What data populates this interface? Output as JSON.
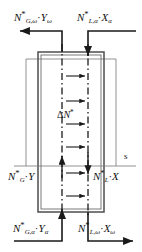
{
  "diagram": {
    "stream_labels": {
      "top_left": {
        "base": "N",
        "sub1": "G,ω",
        "star": "*",
        "times": "·",
        "var": "Y",
        "var_sub": "ω"
      },
      "top_right": {
        "base": "N",
        "sub1": "L,α",
        "star": "*",
        "times": "·",
        "var": "X",
        "var_sub": "α"
      },
      "mid_left": {
        "base": "N",
        "sub1": "G",
        "star": "*",
        "times": "·",
        "var": "Y",
        "var_sub": ""
      },
      "mid_right": {
        "base": "N",
        "sub1": "L",
        "star": "*",
        "times": "·",
        "var": "X",
        "var_sub": ""
      },
      "bottom_left": {
        "base": "N",
        "sub1": "G,α",
        "star": "*",
        "times": "·",
        "var": "Y",
        "var_sub": "α"
      },
      "bottom_right": {
        "base": "N",
        "sub1": "L,ω",
        "star": "*",
        "times": "·",
        "var": "X",
        "var_sub": "ω"
      }
    },
    "transfer_label": {
      "delta": "Δ",
      "base": "N",
      "star": "*"
    },
    "section_label": "s",
    "colors": {
      "line": "#1a1a1a",
      "vessel_wall": "#555555",
      "thin_line": "#777777",
      "text": "#111111",
      "background": "#ffffff"
    },
    "geometry": {
      "column_left": 38,
      "column_right": 104,
      "column_top": 48,
      "column_bottom": 212,
      "gas_axis_x": 62,
      "liquid_axis_x": 88,
      "section_line_y": 166,
      "transfer_arrow_count": 6
    }
  }
}
